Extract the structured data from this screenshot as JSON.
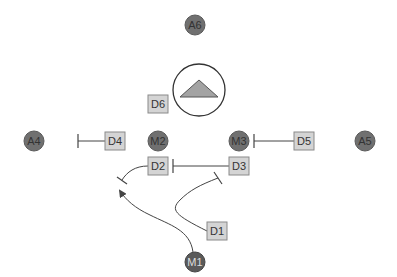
{
  "colors": {
    "circle_fill": "#707070",
    "circle_stroke": "#5a5a5a",
    "box_fill": "#d4d4d4",
    "box_stroke": "#8a8a8a",
    "line": "#444444",
    "triangle_fill": "#a3a3a3"
  },
  "circles": [
    {
      "id": "A6",
      "label": "A6",
      "x": 195,
      "y": 25
    },
    {
      "id": "A4",
      "label": "A4",
      "x": 34,
      "y": 141
    },
    {
      "id": "M2",
      "label": "M2",
      "x": 158,
      "y": 141
    },
    {
      "id": "M3",
      "label": "M3",
      "x": 239,
      "y": 141
    },
    {
      "id": "A5",
      "label": "A5",
      "x": 365,
      "y": 141
    },
    {
      "id": "M1",
      "label": "M1",
      "x": 195,
      "y": 262
    }
  ],
  "boxes": [
    {
      "id": "D6",
      "label": "D6",
      "x": 158,
      "y": 104
    },
    {
      "id": "D4",
      "label": "D4",
      "x": 115,
      "y": 141
    },
    {
      "id": "D5",
      "label": "D5",
      "x": 304,
      "y": 141
    },
    {
      "id": "D2",
      "label": "D2",
      "x": 158,
      "y": 166
    },
    {
      "id": "D3",
      "label": "D3",
      "x": 239,
      "y": 166
    },
    {
      "id": "D1",
      "label": "D1",
      "x": 217,
      "y": 231
    }
  ],
  "big_circle": {
    "id": "triangle-node",
    "x": 199,
    "y": 90,
    "r": 26
  },
  "edges": [
    {
      "from": "D4",
      "to": "A4-side",
      "type": "inhibit"
    },
    {
      "from": "D5",
      "to": "M3",
      "type": "inhibit"
    },
    {
      "from": "D3",
      "to": "D2",
      "type": "inhibit"
    },
    {
      "from": "D2",
      "to": "M1-arrow",
      "type": "inhibit"
    },
    {
      "from": "D1",
      "to": "D3-line",
      "type": "inhibit"
    },
    {
      "from": "M1",
      "to": "D2-curve",
      "type": "activate"
    }
  ]
}
